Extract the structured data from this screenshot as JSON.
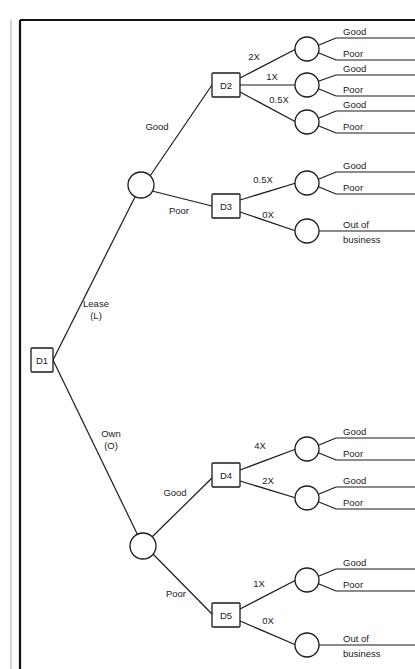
{
  "diagram": {
    "type": "decision-tree"
  },
  "nodes": {
    "d1": "D1",
    "d2": "D2",
    "d3": "D3",
    "d4": "D4",
    "d5": "D5"
  },
  "root_branches": {
    "lease_line1": "Lease",
    "lease_line2": "(L)",
    "own_line1": "Own",
    "own_line2": "(O)"
  },
  "chance_branches": {
    "lease_good": "Good",
    "lease_poor": "Poor",
    "own_good": "Good",
    "own_poor": "Poor"
  },
  "decision_branches": {
    "d2_a": "2X",
    "d2_b": "1X",
    "d2_c": "0.5X",
    "d3_a": "0.5X",
    "d3_b": "0X",
    "d4_a": "4X",
    "d4_b": "2X",
    "d5_a": "1X",
    "d5_b": "0X"
  },
  "outcomes": {
    "o1_good": "Good",
    "o1_poor": "Poor",
    "o2_good": "Good",
    "o2_poor": "Poor",
    "o3_good": "Good",
    "o3_poor": "Poor",
    "o4_good": "Good",
    "o4_poor": "Poor",
    "o5_line1": "Out of",
    "o5_line2": "business",
    "o6_good": "Good",
    "o6_poor": "Poor",
    "o7_good": "Good",
    "o7_poor": "Poor",
    "o8_good": "Good",
    "o8_poor": "Poor",
    "o9_line1": "Out of",
    "o9_line2": "business"
  },
  "colors": {
    "stroke": "#1a1a1a",
    "background": "#ffffff",
    "frame": "#111111"
  }
}
